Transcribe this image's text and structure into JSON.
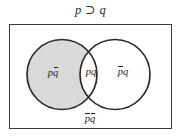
{
  "figure": {
    "title": "p ⊃ q",
    "title_name": "implication-formula",
    "universe_shape": "rectangle",
    "colors": {
      "outline": "#3a3a3a",
      "circle_outline": "#2b2b2b",
      "shaded_fill": "#d9d9d9",
      "unshaded_fill": "#ffffff",
      "background": "#ffffff",
      "text": "#1f1f1f"
    },
    "regions": [
      {
        "id": "p-not-q",
        "label_p": "p",
        "label_q": "q",
        "shaded": true,
        "description": "p and not q"
      },
      {
        "id": "p-and-q",
        "label_p": "p",
        "label_q": "q",
        "shaded": false,
        "description": "p and q"
      },
      {
        "id": "not-p-q",
        "label_p": "p",
        "label_q": "q",
        "shaded": false,
        "description": "not p and q"
      },
      {
        "id": "not-p-not-q",
        "label_p": "p",
        "label_q": "q",
        "shaded": false,
        "description": "not p and not q"
      }
    ],
    "circles": {
      "left": {
        "cx": 62,
        "cy": 74.5,
        "r": 35,
        "shaded": true
      },
      "right": {
        "cx": 115,
        "cy": 74.5,
        "r": 35,
        "shaded": false
      }
    }
  }
}
